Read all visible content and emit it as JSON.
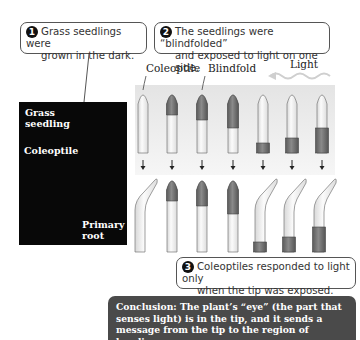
{
  "steps": [
    {
      "number": "1",
      "line1": "Grass seedlings were",
      "line2": "grown in the dark."
    },
    {
      "number": "2",
      "line1": "The seedlings were “blindfolded”",
      "line2": "and exposed to light on one side."
    },
    {
      "number": "3",
      "line1": "Coleoptiles responded to light only",
      "line2": "when the tip was exposed."
    }
  ],
  "photo": {
    "title_line1": "Grass",
    "title_line2": "seedling",
    "coleoptile_label": "Coleoptile",
    "root_line1": "Primary",
    "root_line2": "root"
  },
  "labels": {
    "coleoptile": "Coleoptile",
    "blindfold": "Blindfold",
    "light": "Light"
  },
  "seedlings": [
    {
      "id": "control",
      "blindfold": "none",
      "bends": true
    },
    {
      "id": "tip-covered-small",
      "blindfold": "tip",
      "bends": false
    },
    {
      "id": "tip-covered-medium",
      "blindfold": "tip",
      "bends": false
    },
    {
      "id": "tip-covered-large",
      "blindfold": "tip",
      "bends": false
    },
    {
      "id": "base-covered-small",
      "blindfold": "base",
      "bends": true
    },
    {
      "id": "base-covered-medium",
      "blindfold": "base",
      "bends": true
    },
    {
      "id": "base-covered-large",
      "blindfold": "base",
      "bends": true
    }
  ],
  "colors": {
    "blindfold": "#6e6e6e",
    "coleoptile": "#f2f2f2",
    "conclusion_bg": "#4a4a4a",
    "photo_bg": "#080808"
  },
  "conclusion": {
    "line1": "Conclusion: The plant’s “eye” (the part that",
    "line2": "senses light) is in the tip, and it sends a",
    "line3": "message from the tip to the region of bending."
  }
}
